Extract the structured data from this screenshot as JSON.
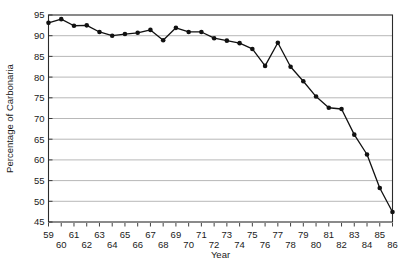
{
  "chart_data": {
    "type": "line",
    "title": "",
    "xlabel": "Year",
    "ylabel": "Percentage of Carbonaria",
    "xlim": [
      59,
      86
    ],
    "ylim": [
      45,
      95
    ],
    "grid": true,
    "legend": false,
    "marker": "filled-circle",
    "y_ticks": [
      45,
      50,
      55,
      60,
      65,
      70,
      75,
      80,
      85,
      90,
      95
    ],
    "x_ticks": [
      59,
      60,
      61,
      62,
      63,
      64,
      65,
      66,
      67,
      68,
      69,
      70,
      71,
      72,
      73,
      74,
      75,
      76,
      77,
      78,
      79,
      80,
      81,
      82,
      83,
      84,
      85,
      86
    ],
    "x": [
      59,
      60,
      61,
      62,
      63,
      64,
      65,
      66,
      67,
      68,
      69,
      70,
      71,
      72,
      73,
      74,
      75,
      76,
      77,
      78,
      79,
      80,
      81,
      82,
      83,
      84,
      85,
      86
    ],
    "values": [
      93.1,
      94.0,
      92.4,
      92.5,
      90.9,
      90.0,
      90.4,
      90.7,
      91.4,
      88.9,
      91.9,
      90.9,
      90.9,
      89.4,
      88.8,
      88.2,
      86.8,
      82.7,
      88.3,
      82.5,
      79.0,
      75.3,
      72.6,
      72.3,
      66.1,
      61.3,
      53.2,
      47.4
    ],
    "series": [
      {
        "name": "Percentage of Carbonaria",
        "values": [
          93.1,
          94.0,
          92.4,
          92.5,
          90.9,
          90.0,
          90.4,
          90.7,
          91.4,
          88.9,
          91.9,
          90.9,
          90.9,
          89.4,
          88.8,
          88.2,
          86.8,
          82.7,
          88.3,
          82.5,
          79.0,
          75.3,
          72.6,
          72.3,
          66.1,
          61.3,
          53.2,
          47.4
        ],
        "color": "#111111"
      }
    ],
    "colors": {
      "line": "#111111",
      "marker": "#111111",
      "grid": "#9a9a9a",
      "frame": "#2b2b2b",
      "background": "#ffffff"
    }
  }
}
